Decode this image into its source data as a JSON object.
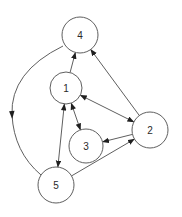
{
  "diagram": {
    "kind": "directed-graph",
    "background": "#ffffff",
    "stroke_color": "#5f5f5f",
    "arrow_color": "#1f1f1f",
    "label_color": "#2a2a2a",
    "stroke_width": 1,
    "nodes": [
      {
        "id": "1",
        "label": "1",
        "x": 66,
        "y": 88,
        "r": 16
      },
      {
        "id": "2",
        "label": "2",
        "x": 150,
        "y": 130,
        "r": 18
      },
      {
        "id": "3",
        "label": "3",
        "x": 86,
        "y": 146,
        "r": 17
      },
      {
        "id": "4",
        "label": "4",
        "x": 80,
        "y": 35,
        "r": 18
      },
      {
        "id": "5",
        "label": "5",
        "x": 56,
        "y": 185,
        "r": 18
      }
    ],
    "edges": [
      {
        "from": "1",
        "to": "4",
        "arrows": "end",
        "shape": "line"
      },
      {
        "from": "2",
        "to": "4",
        "arrows": "end",
        "shape": "line"
      },
      {
        "from": "4",
        "to": "5",
        "arrows": "mid",
        "shape": "curve",
        "path": "M 63 46 Q 10 72 12 115 Q 14 152 41 175",
        "mid": {
          "x": 12,
          "y": 115,
          "angle": 87
        }
      },
      {
        "from": "1",
        "to": "2",
        "arrows": "both",
        "shape": "line"
      },
      {
        "from": "1",
        "to": "3",
        "arrows": "both",
        "shape": "line"
      },
      {
        "from": "1",
        "to": "5",
        "arrows": "both",
        "shape": "line"
      },
      {
        "from": "2",
        "to": "3",
        "arrows": "end",
        "shape": "line"
      },
      {
        "from": "5",
        "to": "2",
        "arrows": "end",
        "shape": "line"
      }
    ]
  }
}
